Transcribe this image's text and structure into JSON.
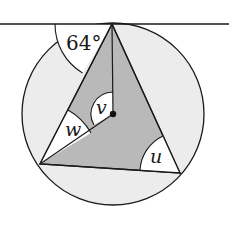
{
  "diagram": {
    "type": "circle-geometry",
    "colors": {
      "circle_fill": "#ececec",
      "triangle_fill": "#b9b9b9",
      "angle_fill": "#ffffff",
      "stroke": "#1a1a1a"
    },
    "labels": {
      "tangent_angle": "64°",
      "angle_v": "v",
      "angle_w": "w",
      "angle_u": "u"
    }
  }
}
